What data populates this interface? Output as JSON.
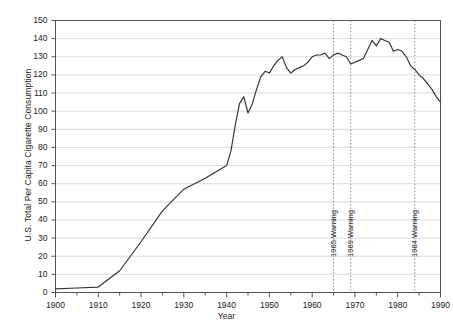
{
  "chart_data": {
    "type": "line",
    "title": "",
    "xlabel": "Year",
    "ylabel": "U.S. Total Per Capita Cigarette Consumption",
    "xlim": [
      1900,
      1990
    ],
    "ylim": [
      0,
      150
    ],
    "grid": true,
    "legend": "none",
    "xticks": [
      "1900",
      "1910",
      "1920",
      "1930",
      "1940",
      "1950",
      "1960",
      "1970",
      "1980",
      "1990"
    ],
    "xtick_values": [
      1900,
      1910,
      1920,
      1930,
      1940,
      1950,
      1960,
      1970,
      1980,
      1990
    ],
    "xminor_step": 5,
    "yticks": [
      "0",
      "10",
      "20",
      "30",
      "40",
      "50",
      "60",
      "70",
      "80",
      "90",
      "100",
      "110",
      "120",
      "130",
      "140",
      "150"
    ],
    "ytick_values": [
      0,
      10,
      20,
      30,
      40,
      50,
      60,
      70,
      80,
      90,
      100,
      110,
      120,
      130,
      140,
      150
    ],
    "series": [
      {
        "name": "U.S. Total Per Capita Cigarette Consumption",
        "color": "#333333",
        "x": [
          1900,
          1905,
          1910,
          1915,
          1920,
          1925,
          1930,
          1935,
          1940,
          1941,
          1942,
          1943,
          1944,
          1945,
          1946,
          1947,
          1948,
          1949,
          1950,
          1951,
          1952,
          1953,
          1954,
          1955,
          1956,
          1957,
          1958,
          1959,
          1960,
          1961,
          1962,
          1963,
          1964,
          1965,
          1966,
          1967,
          1968,
          1969,
          1970,
          1971,
          1972,
          1973,
          1974,
          1975,
          1976,
          1977,
          1978,
          1979,
          1980,
          1981,
          1982,
          1983,
          1984,
          1985,
          1986,
          1987,
          1988,
          1989,
          1990
        ],
        "y": [
          54,
          70,
          85,
          285,
          665,
          1085,
          1485,
          1565,
          1976,
          2236,
          2636,
          2956,
          3039,
          3449,
          3446,
          3416,
          3551,
          3597,
          3552,
          3744,
          3886,
          3778,
          3546,
          3597,
          3650,
          3672,
          3699,
          3853,
          4171,
          4266,
          4266,
          4345,
          4194,
          4258,
          4287,
          4280,
          4186,
          3993,
          3985,
          4037,
          4043,
          4148,
          4141,
          4123,
          4092,
          4051,
          3967,
          3801,
          3849,
          3836,
          3711,
          3488,
          3446,
          3370,
          3274,
          3197,
          3096,
          2926,
          2828
        ],
        "y_note": "values are per capita cigarettes; chart axis shows tens (value/10 plotted as 0-150 scale x10)"
      }
    ],
    "plotted_values": {
      "note": "Axis reads 0-150; curve values as read off the chart",
      "x": [
        1900,
        1905,
        1910,
        1915,
        1920,
        1925,
        1930,
        1935,
        1940,
        1941,
        1942,
        1943,
        1944,
        1945,
        1946,
        1947,
        1948,
        1949,
        1950,
        1951,
        1952,
        1953,
        1954,
        1955,
        1956,
        1957,
        1958,
        1959,
        1960,
        1961,
        1962,
        1963,
        1964,
        1965,
        1966,
        1967,
        1968,
        1969,
        1970,
        1971,
        1972,
        1973,
        1974,
        1975,
        1976,
        1977,
        1978,
        1979,
        1980,
        1981,
        1982,
        1983,
        1984,
        1985,
        1986,
        1987,
        1988,
        1989,
        1990
      ],
      "y": [
        2,
        2.5,
        3,
        12,
        28,
        45,
        57,
        63,
        70,
        78,
        92,
        104,
        108,
        99,
        104,
        112,
        119,
        122,
        121,
        125,
        128,
        130,
        124,
        121,
        123,
        124,
        125,
        127,
        130,
        131,
        131,
        132,
        129,
        131,
        132,
        131,
        130,
        126,
        127,
        128,
        129,
        134,
        139,
        136,
        140,
        139,
        138,
        133,
        134,
        133,
        130,
        125,
        123,
        120,
        118,
        115,
        112,
        108,
        105
      ]
    },
    "annotations": [
      {
        "id": "warning-1965",
        "label": "1965 Warning",
        "x": 1965,
        "line_style": "dotted"
      },
      {
        "id": "warning-1969",
        "label": "1969 Warning",
        "x": 1969,
        "line_style": "dotted"
      },
      {
        "id": "warning-1984",
        "label": "1984 Warning",
        "x": 1984,
        "line_style": "dotted"
      }
    ],
    "colors": {
      "line": "#333333",
      "grid": "#cccccc",
      "axis": "#555555",
      "annotation_line": "#888888",
      "background": "#ffffff"
    }
  }
}
